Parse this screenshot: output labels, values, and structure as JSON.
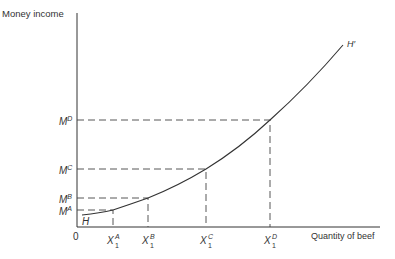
{
  "diagram": {
    "y_axis_label": "Money income",
    "x_axis_label": "Quantity of beef",
    "origin_label": "0",
    "curve_start_label": "H",
    "curve_end_label": "H′",
    "y_levels": [
      {
        "base": "M",
        "sup": "A"
      },
      {
        "base": "M",
        "sup": "B"
      },
      {
        "base": "M",
        "sup": "C"
      },
      {
        "base": "M",
        "sup": "D"
      }
    ],
    "x_levels": [
      {
        "base": "X",
        "sup": "A",
        "sub": "1"
      },
      {
        "base": "X",
        "sup": "B",
        "sub": "1"
      },
      {
        "base": "X",
        "sup": "C",
        "sub": "1"
      },
      {
        "base": "X",
        "sup": "D",
        "sub": "1"
      }
    ],
    "line_color": "#333333"
  }
}
